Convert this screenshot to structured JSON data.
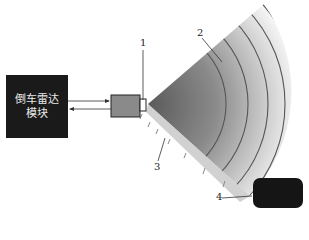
{
  "diagram": {
    "module": {
      "line1": "倒车雷达",
      "line2": "模块"
    },
    "callouts": [
      {
        "id": "1",
        "label": "1"
      },
      {
        "id": "2",
        "label": "2"
      },
      {
        "id": "3",
        "label": "3"
      },
      {
        "id": "4",
        "label": "4"
      }
    ],
    "colors": {
      "module": "#1a1a1a",
      "fan_dark": "#6a6a6a",
      "fan_light": "#f0f0f0",
      "arc": "#555555",
      "obstacle": "#151515"
    }
  }
}
